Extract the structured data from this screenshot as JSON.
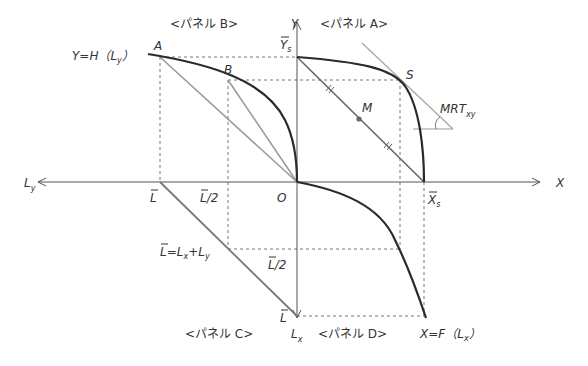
{
  "panels": {
    "a": "<パネル A>",
    "b": "<パネル B>",
    "c": "<パネル C>",
    "d": "<パネル D>"
  },
  "axes": {
    "y": "Y",
    "x": "X",
    "ly": "L",
    "ly_sub": "y",
    "lx": "L",
    "lx_sub": "x",
    "origin": "O"
  },
  "labels": {
    "ys": "Y",
    "ys_sub": "s",
    "xs": "X",
    "xs_sub": "s",
    "h_func": "Y=H（L",
    "h_func_sub": "y",
    "h_func_close": "）",
    "f_func": "X=F（L",
    "f_func_sub": "x",
    "f_func_close": "）",
    "point_a": "A",
    "point_b": "B",
    "point_s": "S",
    "point_m": "M",
    "mrt": "MRT",
    "mrt_sub": "xy",
    "l_bar_left": "L",
    "l_half_left": "L/2",
    "l_constraint": "L=L",
    "l_constraint_mid": "x",
    "l_constraint_plus": "+L",
    "l_constraint_sub": "y",
    "l_half_down": "L/2",
    "l_bar_down": "L"
  },
  "colors": {
    "curve": "#2a2a2a",
    "axis": "#555555",
    "gray_line": "#9a9a9a",
    "dashed": "#777777"
  }
}
